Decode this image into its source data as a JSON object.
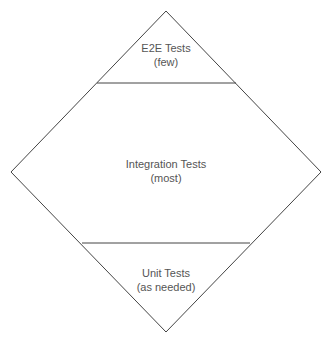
{
  "diagram": {
    "type": "testing-diamond",
    "colors": {
      "stroke": "#444444",
      "text": "#555555",
      "background": "#ffffff"
    },
    "sections": [
      {
        "id": "e2e",
        "title": "E2E Tests",
        "subtitle": "(few)"
      },
      {
        "id": "integration",
        "title": "Integration Tests",
        "subtitle": "(most)"
      },
      {
        "id": "unit",
        "title": "Unit Tests",
        "subtitle": "(as needed)"
      }
    ]
  }
}
